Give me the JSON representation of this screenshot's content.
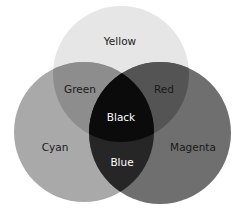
{
  "diagram": {
    "type": "venn",
    "circles": [
      {
        "id": "yellow",
        "label": "Yellow",
        "cx": 121,
        "cy": 74,
        "r": 68,
        "color": "#e6e6e6"
      },
      {
        "id": "cyan",
        "label": "Cyan",
        "cx": 84,
        "cy": 132,
        "r": 70,
        "color": "#a9a9a9"
      },
      {
        "id": "magenta",
        "label": "Magenta",
        "cx": 160,
        "cy": 133,
        "r": 71,
        "color": "#6f6f6f"
      }
    ],
    "regions": {
      "yellow": {
        "label": "Yellow",
        "color": "#e6e6e6"
      },
      "cyan": {
        "label": "Cyan",
        "color": "#a9a9a9"
      },
      "magenta": {
        "label": "Magenta",
        "color": "#6f6f6f"
      },
      "green": {
        "label": "Green",
        "color": "#8d8d8d"
      },
      "red": {
        "label": "Red",
        "color": "#545454"
      },
      "blue": {
        "label": "Blue",
        "color": "#262626"
      },
      "black": {
        "label": "Black",
        "color": "#0b0b0b"
      }
    }
  }
}
